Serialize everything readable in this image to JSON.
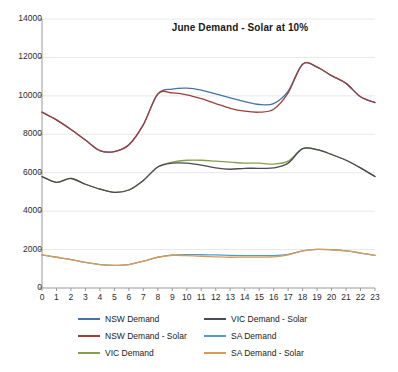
{
  "chart_data": {
    "type": "line",
    "title": "June Demand - Solar at 10%",
    "xlabel": "",
    "ylabel": "",
    "xlim": [
      0,
      23
    ],
    "ylim": [
      0,
      14000
    ],
    "ytick_step": 2000,
    "grid": true,
    "legend_position": "bottom",
    "x": [
      0,
      1,
      2,
      3,
      4,
      5,
      6,
      7,
      8,
      9,
      10,
      11,
      12,
      13,
      14,
      15,
      16,
      17,
      18,
      19,
      20,
      21,
      22,
      23
    ],
    "xtick_labels": [
      "0",
      "1",
      "2",
      "3",
      "4",
      "5",
      "6",
      "7",
      "8",
      "9",
      "10",
      "11",
      "12",
      "13",
      "14",
      "15",
      "16",
      "17",
      "18",
      "19",
      "20",
      "21",
      "22",
      "23"
    ],
    "ytick_labels": [
      "0",
      "2000",
      "4000",
      "6000",
      "8000",
      "10000",
      "12000",
      "14000"
    ],
    "series": [
      {
        "name": "NSW Demand",
        "color": "#4472a8",
        "values": [
          9150,
          8750,
          8250,
          7700,
          7150,
          7100,
          7450,
          8500,
          10100,
          10350,
          10400,
          10300,
          10100,
          9900,
          9700,
          9550,
          9600,
          10250,
          11650,
          11500,
          11050,
          10650,
          9950,
          9650
        ]
      },
      {
        "name": "NSW Demand - Solar",
        "color": "#9c4038",
        "values": [
          9150,
          8750,
          8250,
          7700,
          7150,
          7100,
          7450,
          8500,
          10100,
          10150,
          10050,
          9850,
          9600,
          9350,
          9200,
          9150,
          9300,
          10150,
          11650,
          11500,
          11050,
          10650,
          9950,
          9650
        ]
      },
      {
        "name": "VIC Demand",
        "color": "#84a04c",
        "values": [
          5800,
          5500,
          5700,
          5400,
          5150,
          4980,
          5100,
          5600,
          6300,
          6550,
          6650,
          6650,
          6600,
          6550,
          6500,
          6500,
          6450,
          6600,
          7250,
          7200,
          6950,
          6650,
          6250,
          5800
        ]
      },
      {
        "name": "VIC Demand - Solar",
        "color": "#4a4a56",
        "values": [
          5800,
          5500,
          5700,
          5400,
          5150,
          4980,
          5100,
          5600,
          6300,
          6500,
          6500,
          6400,
          6250,
          6180,
          6230,
          6230,
          6250,
          6500,
          7250,
          7200,
          6950,
          6650,
          6250,
          5800
        ]
      },
      {
        "name": "SA Demand",
        "color": "#4f9ecb",
        "values": [
          1720,
          1600,
          1480,
          1330,
          1220,
          1180,
          1220,
          1400,
          1600,
          1720,
          1740,
          1730,
          1720,
          1700,
          1690,
          1690,
          1680,
          1750,
          1930,
          2010,
          1990,
          1930,
          1820,
          1700
        ]
      },
      {
        "name": "SA Demand - Solar",
        "color": "#dd9a52",
        "values": [
          1720,
          1600,
          1480,
          1330,
          1220,
          1180,
          1220,
          1400,
          1600,
          1700,
          1680,
          1650,
          1620,
          1600,
          1610,
          1610,
          1620,
          1720,
          1930,
          2010,
          1990,
          1930,
          1820,
          1700
        ]
      }
    ],
    "legend_order": [
      "NSW Demand",
      "VIC Demand - Solar",
      "NSW Demand - Solar",
      "SA Demand",
      "VIC Demand",
      "SA Demand - Solar"
    ]
  },
  "style": {
    "axis_color": "#9a9a9a",
    "grid_color": "#e8e8e8",
    "background": "#ffffff",
    "text_color": "#2b2b2b"
  },
  "plot_geometry": {
    "left": 42,
    "right": 375,
    "top": 19,
    "bottom": 288
  }
}
